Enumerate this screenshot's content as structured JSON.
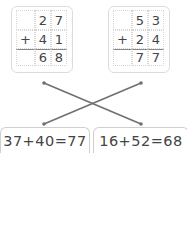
{
  "problems": [
    {
      "rows": [
        [
          "",
          "2",
          "7"
        ],
        [
          "+",
          "4",
          "1"
        ],
        [
          "",
          "6",
          "8"
        ]
      ]
    },
    {
      "rows": [
        [
          "",
          "5",
          "3"
        ],
        [
          "+",
          "2",
          "4"
        ],
        [
          "",
          "7",
          "7"
        ]
      ]
    }
  ],
  "equations": [
    {
      "text": "37+40=77"
    },
    {
      "text": "16+52=68"
    }
  ],
  "colors": {
    "line": "#707070",
    "border": "#dcdcdc",
    "text": "#444444"
  }
}
